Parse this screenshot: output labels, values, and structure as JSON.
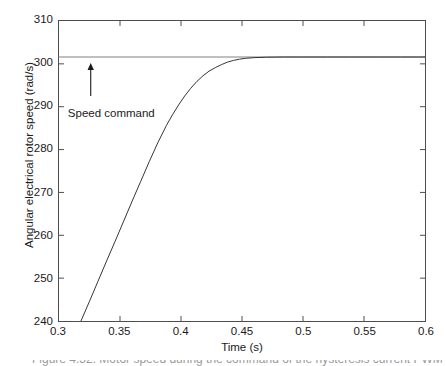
{
  "chart_data": {
    "type": "line",
    "title": "",
    "xlabel": "Time (s)",
    "ylabel": "Angular electrical rotor speed (rad/s)",
    "xlim": [
      0.3,
      0.6
    ],
    "ylim": [
      240,
      310
    ],
    "xticks": [
      0.3,
      0.35,
      0.4,
      0.45,
      0.5,
      0.55,
      0.6
    ],
    "xtick_labels": [
      "0.3",
      "0.35",
      "0.4",
      "0.45",
      "0.5",
      "0.55",
      "0.6"
    ],
    "yticks": [
      240,
      250,
      260,
      270,
      280,
      290,
      300,
      310
    ],
    "ytick_labels": [
      "240",
      "250",
      "260",
      "270",
      "280",
      "290",
      "300",
      "310"
    ],
    "grid": false,
    "legend": null,
    "annotations": [
      {
        "name": "speed-command-annotation",
        "text": "Speed command",
        "text_x": 0.308,
        "text_y": 288.5,
        "arrow_from_x": 0.326,
        "arrow_from_y": 292.5,
        "arrow_to_x": 0.326,
        "arrow_to_y": 300.2
      }
    ],
    "series": [
      {
        "name": "Speed command",
        "type": "line",
        "color": "#808080",
        "linewidth": 1,
        "constant_value": 301.6,
        "x": [
          0.3,
          0.6
        ],
        "y": [
          301.6,
          301.6
        ]
      },
      {
        "name": "Angular electrical rotor speed",
        "type": "line",
        "color": "#333333",
        "linewidth": 1,
        "x": [
          0.318,
          0.325,
          0.332,
          0.339,
          0.346,
          0.353,
          0.36,
          0.367,
          0.374,
          0.381,
          0.388,
          0.393,
          0.398,
          0.403,
          0.408,
          0.413,
          0.418,
          0.423,
          0.428,
          0.433,
          0.438,
          0.443,
          0.448,
          0.453,
          0.46,
          0.47,
          0.485,
          0.5,
          0.52,
          0.54,
          0.56,
          0.58,
          0.6
        ],
        "y": [
          240.0,
          244.6,
          249.3,
          254.0,
          258.6,
          263.3,
          268.0,
          272.6,
          277.2,
          281.6,
          285.6,
          288.1,
          290.4,
          292.5,
          294.3,
          295.9,
          297.2,
          298.3,
          299.1,
          299.8,
          300.4,
          300.8,
          301.1,
          301.3,
          301.45,
          301.55,
          301.6,
          301.6,
          301.6,
          301.6,
          301.6,
          301.6,
          301.6
        ]
      }
    ]
  },
  "caption": {
    "sliver_text": "Figure 4.32.  Motor speed during the command of the hysteresis current PWM voltage source"
  },
  "colors": {
    "axis": "#4d4d4d",
    "curve": "#333333",
    "command_line": "#808080",
    "text": "#1a1a1a",
    "background": "#ffffff"
  }
}
